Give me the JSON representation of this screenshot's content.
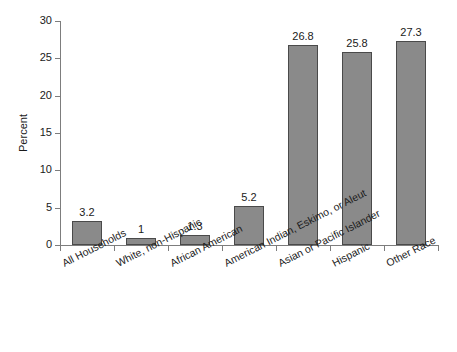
{
  "chart_data": {
    "type": "bar",
    "title": "",
    "xlabel": "",
    "ylabel": "Percent",
    "ylim": [
      0,
      30
    ],
    "yticks": [
      0,
      5,
      10,
      15,
      20,
      25,
      30
    ],
    "grid": false,
    "legend": null,
    "categories": [
      "All Households",
      "White, non-Hispanic",
      "African American",
      "American Indian, Eskimo, or Aleut",
      "Asian or Pacific Islander",
      "Hispanic",
      "Other Race"
    ],
    "values": [
      3.2,
      1,
      1.3,
      5.2,
      26.8,
      25.8,
      27.3
    ],
    "value_labels": [
      "3.2",
      "1",
      "1.3",
      "5.2",
      "26.8",
      "25.8",
      "27.3"
    ],
    "bar_color": "#8a8a8a",
    "bar_border_color": "#4a4a4a",
    "axis_color": "#7d7d7d",
    "background_color": "#ffffff"
  },
  "axis": {
    "y_tick_labels": [
      "30",
      "25",
      "20",
      "15",
      "10",
      "5",
      "0"
    ]
  }
}
